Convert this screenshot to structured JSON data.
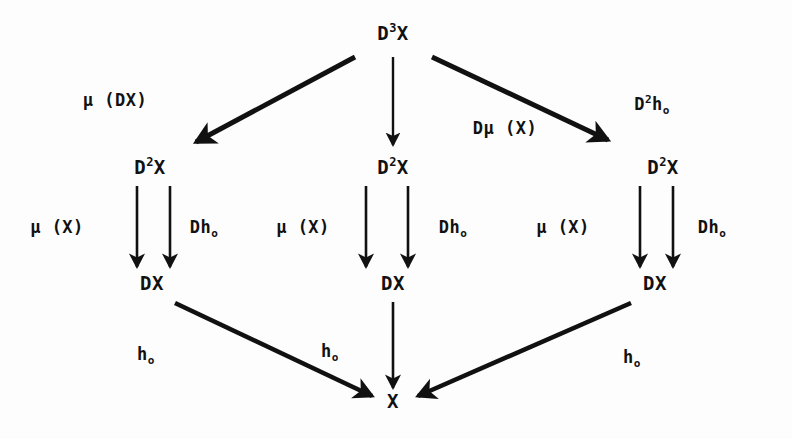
{
  "document": {
    "kind": "commutative-diagram",
    "background_color": "#fdfdfd",
    "ink_color": "#111111",
    "width": 792,
    "height": 439
  },
  "nodes": {
    "top": {
      "base": "D",
      "sup": "3",
      "tail": "X",
      "x": 393,
      "y": 33
    },
    "mid_left": {
      "base": "D",
      "sup": "2",
      "tail": "X",
      "x": 150,
      "y": 167
    },
    "mid_center": {
      "base": "D",
      "sup": "2",
      "tail": "X",
      "x": 393,
      "y": 167
    },
    "mid_right": {
      "base": "D",
      "sup": "2",
      "tail": "X",
      "x": 663,
      "y": 167
    },
    "low_left": {
      "base": "DX",
      "x": 152,
      "y": 283
    },
    "low_center": {
      "base": "DX",
      "x": 393,
      "y": 283
    },
    "low_right": {
      "base": "DX",
      "x": 655,
      "y": 283
    },
    "bottom": {
      "base": "X",
      "x": 393,
      "y": 401
    }
  },
  "labels": {
    "mu_DX": {
      "text": "μ (DX)",
      "x": 115,
      "y": 100
    },
    "D_mu_X": {
      "text": "Dμ (X)",
      "x": 505,
      "y": 128
    },
    "D2_h0": {
      "base": "D",
      "sup": "2",
      "tail": "h",
      "sub": "o",
      "x": 652,
      "y": 104
    },
    "mu_X_left": {
      "text": "μ (X)",
      "x": 57,
      "y": 227
    },
    "mu_X_center": {
      "text": "μ (X)",
      "x": 303,
      "y": 227
    },
    "mu_X_right": {
      "text": "μ (X)",
      "x": 563,
      "y": 227
    },
    "Dh_left": {
      "base": "Dh",
      "sub": "o",
      "x": 204,
      "y": 227
    },
    "Dh_center": {
      "base": "Dh",
      "sub": "o",
      "x": 453,
      "y": 227
    },
    "Dh_right": {
      "base": "Dh",
      "sub": "o",
      "x": 712,
      "y": 227
    },
    "h0_far_left": {
      "base": "h",
      "sub": "o",
      "x": 146,
      "y": 354
    },
    "h0_mid_left": {
      "base": "h",
      "sub": "o",
      "x": 330,
      "y": 351
    },
    "h0_right": {
      "base": "h",
      "sub": "o",
      "x": 632,
      "y": 357
    }
  },
  "arrows": {
    "top_to_mid_left": {
      "from": [
        355,
        57
      ],
      "to": [
        196,
        142
      ],
      "style": "thick-diagonal"
    },
    "top_to_mid_center": {
      "from": [
        393,
        57
      ],
      "to": [
        393,
        145
      ],
      "style": "thin-vertical"
    },
    "top_to_mid_right": {
      "from": [
        432,
        57
      ],
      "to": [
        608,
        140
      ],
      "style": "thick-diagonal"
    },
    "mid_left_pair_a": {
      "from": [
        137,
        186
      ],
      "to": [
        137,
        267
      ],
      "style": "thin-vertical"
    },
    "mid_left_pair_b": {
      "from": [
        170,
        186
      ],
      "to": [
        170,
        267
      ],
      "style": "thin-vertical"
    },
    "mid_center_pair_a": {
      "from": [
        366,
        186
      ],
      "to": [
        366,
        267
      ],
      "style": "thin-vertical"
    },
    "mid_center_pair_b": {
      "from": [
        408,
        186
      ],
      "to": [
        408,
        267
      ],
      "style": "thin-vertical"
    },
    "mid_right_pair_a": {
      "from": [
        640,
        186
      ],
      "to": [
        640,
        267
      ],
      "style": "thin-vertical"
    },
    "mid_right_pair_b": {
      "from": [
        673,
        186
      ],
      "to": [
        673,
        267
      ],
      "style": "thin-vertical"
    },
    "low_left_to_bottom": {
      "from": [
        175,
        303
      ],
      "to": [
        372,
        396
      ],
      "style": "thick-diagonal"
    },
    "low_center_to_bottom": {
      "from": [
        393,
        302
      ],
      "to": [
        393,
        388
      ],
      "style": "thin-vertical"
    },
    "low_right_to_bottom": {
      "from": [
        631,
        303
      ],
      "to": [
        418,
        396
      ],
      "style": "thick-diagonal"
    }
  }
}
